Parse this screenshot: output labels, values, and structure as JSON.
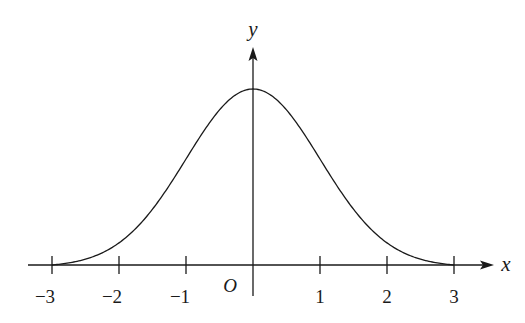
{
  "chart_data": {
    "type": "line",
    "title": "",
    "xlabel": "x",
    "ylabel": "y",
    "origin_label": "O",
    "x_ticks": [
      -3,
      -2,
      -1,
      1,
      2,
      3
    ],
    "x_tick_labels": [
      "−3",
      "−2",
      "−1",
      "1",
      "2",
      "3"
    ],
    "xlim": [
      -3.3,
      3.6
    ],
    "curve": "bell-shaped (normal density) curve symmetric about y-axis, peak at x=0, approaching x-axis near x=±3",
    "series": [
      {
        "name": "curve",
        "x": [
          -3,
          -2.5,
          -2,
          -1.5,
          -1,
          -0.5,
          0,
          0.5,
          1,
          1.5,
          2,
          2.5,
          3
        ],
        "y_relative": [
          0.0,
          0.05,
          0.14,
          0.33,
          0.61,
          0.88,
          1.0,
          0.88,
          0.61,
          0.33,
          0.14,
          0.05,
          0.0
        ]
      }
    ],
    "grid": false,
    "legend": null
  },
  "labels": {
    "x_axis": "x",
    "y_axis": "y",
    "origin": "O",
    "ticks": [
      "−3",
      "−2",
      "−1",
      "1",
      "2",
      "3"
    ]
  }
}
